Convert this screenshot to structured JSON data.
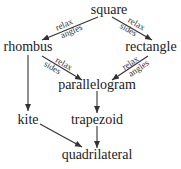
{
  "nodes": {
    "square": "square",
    "rhombus": "rhombus",
    "rectangle": "rectangle",
    "parallelogram": "parallelogram",
    "kite": "kite",
    "trapezoid": "trapezoid",
    "quadrilateral": "quadrilateral"
  },
  "edges": [
    {
      "from": "square",
      "to": "rhombus",
      "label": [
        "relax",
        "angles"
      ]
    },
    {
      "from": "square",
      "to": "rectangle",
      "label": [
        "relax",
        "sides"
      ]
    },
    {
      "from": "rhombus",
      "to": "parallelogram",
      "label": [
        "relax",
        "sides"
      ]
    },
    {
      "from": "rectangle",
      "to": "parallelogram",
      "label": [
        "relax",
        "angles"
      ]
    },
    {
      "from": "rhombus",
      "to": "kite",
      "label": []
    },
    {
      "from": "parallelogram",
      "to": "trapezoid",
      "label": []
    },
    {
      "from": "kite",
      "to": "quadrilateral",
      "label": []
    },
    {
      "from": "trapezoid",
      "to": "quadrilateral",
      "label": []
    }
  ]
}
